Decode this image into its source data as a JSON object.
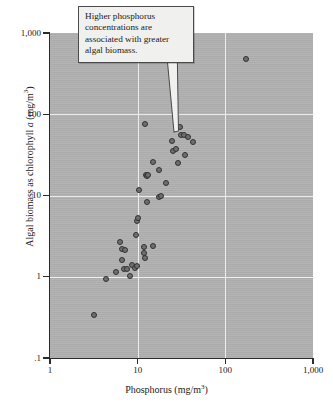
{
  "annotation": {
    "text": "Higher phosphorus concentrations are associated with greater algal biomass.",
    "points_to": {
      "x": 12,
      "y": 75
    }
  },
  "colors": {
    "plot_background": "#b1b1b1",
    "gridline": "#f2f2f2",
    "axis": "#2b2b2b",
    "marker_fill": "#6e6e6e",
    "marker_edge": "#2e2e2e",
    "callout_background": "#f0f0ee",
    "page_background": "#ffffff"
  },
  "chart_data": {
    "type": "scatter",
    "title": "",
    "xlabel": "Phosphorus (mg/m³)",
    "ylabel": "Algal biomass as chlorophyll a (mg/m³)",
    "ylabel_parts": {
      "pre": "Algal biomass as chlorophyll ",
      "italic": "a",
      "post": " (mg/m",
      "sup": "3",
      "end": ")"
    },
    "xlabel_parts": {
      "pre": "Phosphorus (mg/m",
      "sup": "3",
      "post": ")"
    },
    "xscale": "log",
    "yscale": "log",
    "xlim": [
      1,
      1000
    ],
    "ylim": [
      0.1,
      1000
    ],
    "grid": true,
    "legend": null,
    "xticks": [
      1,
      10,
      100,
      1000
    ],
    "xticklabels": [
      "1",
      "10",
      "100",
      "1,000"
    ],
    "yticks": [
      0.1,
      1,
      10,
      100,
      1000
    ],
    "yticklabels": [
      ".1",
      "1",
      "10",
      "100",
      "1,000"
    ],
    "points": [
      {
        "x": 3.2,
        "y": 0.34
      },
      {
        "x": 4.3,
        "y": 0.93
      },
      {
        "x": 5.6,
        "y": 1.14
      },
      {
        "x": 6.3,
        "y": 2.7
      },
      {
        "x": 6.6,
        "y": 2.18
      },
      {
        "x": 7.2,
        "y": 2.15
      },
      {
        "x": 6.6,
        "y": 1.62
      },
      {
        "x": 6.9,
        "y": 1.26
      },
      {
        "x": 7.5,
        "y": 1.25
      },
      {
        "x": 8.2,
        "y": 1.02
      },
      {
        "x": 8.6,
        "y": 1.38
      },
      {
        "x": 9.4,
        "y": 1.3
      },
      {
        "x": 9.8,
        "y": 1.34
      },
      {
        "x": 9.6,
        "y": 3.3
      },
      {
        "x": 9.9,
        "y": 4.9
      },
      {
        "x": 10.1,
        "y": 5.3
      },
      {
        "x": 11.8,
        "y": 2.3
      },
      {
        "x": 11.9,
        "y": 1.95
      },
      {
        "x": 12.1,
        "y": 1.72
      },
      {
        "x": 15.0,
        "y": 2.4
      },
      {
        "x": 12.6,
        "y": 8.4
      },
      {
        "x": 17.5,
        "y": 9.6
      },
      {
        "x": 18.6,
        "y": 9.9
      },
      {
        "x": 10.3,
        "y": 11.6
      },
      {
        "x": 12.5,
        "y": 17.8
      },
      {
        "x": 12.9,
        "y": 17.6
      },
      {
        "x": 13.2,
        "y": 18.0
      },
      {
        "x": 15.1,
        "y": 26.0
      },
      {
        "x": 17.6,
        "y": 20.5
      },
      {
        "x": 21.0,
        "y": 14.2
      },
      {
        "x": 29.0,
        "y": 25.5
      },
      {
        "x": 35.0,
        "y": 32.0
      },
      {
        "x": 25.5,
        "y": 35.5
      },
      {
        "x": 27.5,
        "y": 37.5
      },
      {
        "x": 24.5,
        "y": 47.0
      },
      {
        "x": 31.5,
        "y": 55.0
      },
      {
        "x": 33.5,
        "y": 55.5
      },
      {
        "x": 37.5,
        "y": 52.0
      },
      {
        "x": 43.0,
        "y": 46.0
      },
      {
        "x": 30.0,
        "y": 70.0
      },
      {
        "x": 12.0,
        "y": 75.0
      },
      {
        "x": 170.0,
        "y": 480.0
      }
    ]
  }
}
